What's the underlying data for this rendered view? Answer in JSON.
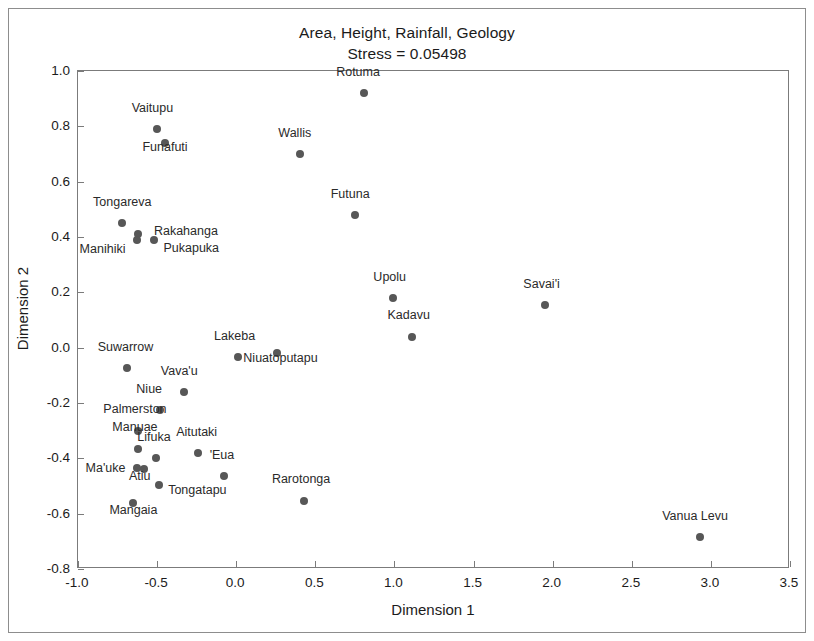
{
  "chart_data": {
    "type": "scatter",
    "title": "Area, Height, Rainfall, Geology",
    "subtitle": "Stress = 0.05498",
    "xlabel": "Dimension 1",
    "ylabel": "Dimension 2",
    "xlim": [
      -1.0,
      3.5
    ],
    "ylim": [
      -0.8,
      1.0
    ],
    "xticks": [
      "-1.0",
      "-0.5",
      "0.0",
      "0.5",
      "1.0",
      "1.5",
      "2.0",
      "2.5",
      "3.0",
      "3.5"
    ],
    "xtick_values": [
      -1.0,
      -0.5,
      0.0,
      0.5,
      1.0,
      1.5,
      2.0,
      2.5,
      3.0,
      3.5
    ],
    "yticks": [
      "1.0",
      "0.8",
      "0.6",
      "0.4",
      "0.2",
      "0.0",
      "-0.2",
      "-0.4",
      "-0.6",
      "-0.8"
    ],
    "ytick_values": [
      1.0,
      0.8,
      0.6,
      0.4,
      0.2,
      0.0,
      -0.2,
      -0.4,
      -0.6,
      -0.8
    ],
    "grid": false,
    "legend": "none",
    "marker_color": "#575757",
    "points": [
      {
        "label": "Rotuma",
        "x": 0.81,
        "y": 0.92,
        "lx": -0.04,
        "ly": 0.055,
        "anchor": "center"
      },
      {
        "label": "Vaitupu",
        "x": -0.5,
        "y": 0.79,
        "lx": -0.03,
        "ly": 0.055,
        "anchor": "center"
      },
      {
        "label": "Funafuti",
        "x": -0.45,
        "y": 0.74,
        "lx": 0.0,
        "ly": -0.035,
        "anchor": "center"
      },
      {
        "label": "Wallis",
        "x": 0.4,
        "y": 0.7,
        "lx": -0.03,
        "ly": 0.055,
        "anchor": "center"
      },
      {
        "label": "Futuna",
        "x": 0.75,
        "y": 0.48,
        "lx": -0.03,
        "ly": 0.055,
        "anchor": "center"
      },
      {
        "label": "Tongareva",
        "x": -0.72,
        "y": 0.45,
        "lx": 0.0,
        "ly": 0.055,
        "anchor": "center"
      },
      {
        "label": "Rakahanga",
        "x": -0.62,
        "y": 0.41,
        "lx": 0.1,
        "ly": 0.013,
        "anchor": "left"
      },
      {
        "label": "Manihiki",
        "x": -0.63,
        "y": 0.39,
        "lx": -0.07,
        "ly": -0.035,
        "anchor": "right"
      },
      {
        "label": "Pukapuka",
        "x": -0.52,
        "y": 0.39,
        "lx": 0.06,
        "ly": -0.028,
        "anchor": "left"
      },
      {
        "label": "Upolu",
        "x": 0.99,
        "y": 0.18,
        "lx": -0.02,
        "ly": 0.055,
        "anchor": "center"
      },
      {
        "label": "Savai'i",
        "x": 1.95,
        "y": 0.155,
        "lx": -0.02,
        "ly": 0.055,
        "anchor": "center"
      },
      {
        "label": "Kadavu",
        "x": 1.11,
        "y": 0.04,
        "lx": -0.02,
        "ly": 0.055,
        "anchor": "center"
      },
      {
        "label": "Lakeba",
        "x": 0.01,
        "y": -0.035,
        "lx": -0.02,
        "ly": 0.055,
        "anchor": "center"
      },
      {
        "label": "Niuatoputapu",
        "x": 0.26,
        "y": -0.02,
        "lx": 0.02,
        "ly": -0.04,
        "anchor": "center"
      },
      {
        "label": "Suwarrow",
        "x": -0.69,
        "y": -0.075,
        "lx": -0.01,
        "ly": 0.055,
        "anchor": "center"
      },
      {
        "label": "Vava'u",
        "x": -0.33,
        "y": -0.16,
        "lx": -0.03,
        "ly": 0.055,
        "anchor": "center"
      },
      {
        "label": "Niue",
        "x": -0.48,
        "y": -0.225,
        "lx": -0.07,
        "ly": 0.055,
        "anchor": "center"
      },
      {
        "label": "Palmerston",
        "x": -0.62,
        "y": -0.3,
        "lx": -0.02,
        "ly": 0.055,
        "anchor": "center"
      },
      {
        "label": "Aitutaki",
        "x": -0.24,
        "y": -0.38,
        "lx": -0.01,
        "ly": 0.055,
        "anchor": "center"
      },
      {
        "label": "Manuae",
        "x": -0.62,
        "y": -0.365,
        "lx": -0.02,
        "ly": 0.055,
        "anchor": "center"
      },
      {
        "label": "Lifuka",
        "x": -0.51,
        "y": -0.4,
        "lx": -0.01,
        "ly": 0.055,
        "anchor": "center"
      },
      {
        "label": "Ma'uke",
        "x": -0.63,
        "y": -0.435,
        "lx": -0.07,
        "ly": 0.0,
        "anchor": "right"
      },
      {
        "label": "Atiu",
        "x": -0.58,
        "y": -0.44,
        "lx": -0.03,
        "ly": -0.045,
        "anchor": "center"
      },
      {
        "label": "'Eua",
        "x": -0.08,
        "y": -0.465,
        "lx": -0.01,
        "ly": 0.055,
        "anchor": "center"
      },
      {
        "label": "Tongatapu",
        "x": -0.49,
        "y": -0.495,
        "lx": 0.06,
        "ly": -0.018,
        "anchor": "left"
      },
      {
        "label": "Mangaia",
        "x": -0.65,
        "y": -0.56,
        "lx": 0.0,
        "ly": -0.05,
        "anchor": "center"
      },
      {
        "label": "Rarotonga",
        "x": 0.43,
        "y": -0.555,
        "lx": -0.02,
        "ly": 0.057,
        "anchor": "center"
      },
      {
        "label": "Vanua Levu",
        "x": 2.93,
        "y": -0.685,
        "lx": -0.03,
        "ly": 0.055,
        "anchor": "center"
      }
    ]
  }
}
